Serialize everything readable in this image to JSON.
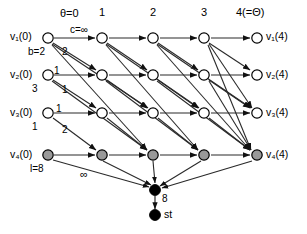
{
  "diagram": {
    "type": "time-expanded-network",
    "title": "",
    "column_headers": [
      {
        "id": "col0",
        "text": "θ=0",
        "x": 64,
        "y": 14
      },
      {
        "id": "col1",
        "text": "1",
        "x": 100,
        "y": 12
      },
      {
        "id": "col2",
        "text": "2",
        "x": 151,
        "y": 12
      },
      {
        "id": "col3",
        "text": "3",
        "x": 202,
        "y": 12
      },
      {
        "id": "col4",
        "text": "4(=Θ)",
        "x": 239,
        "y": 12
      }
    ],
    "left_labels": [
      {
        "id": "v1-0",
        "text": "v₁(0)",
        "x": 11,
        "y": 32
      },
      {
        "id": "v2-0",
        "text": "v₂(0)",
        "x": 11,
        "y": 69
      },
      {
        "id": "v3-0",
        "text": "v₃(0)",
        "x": 11,
        "y": 107
      },
      {
        "id": "v4-0",
        "text": "v₄(0)",
        "x": 11,
        "y": 149
      }
    ],
    "right_labels": [
      {
        "id": "v1-4",
        "text": "v₁(4)",
        "x": 267,
        "y": 32
      },
      {
        "id": "v2-4",
        "text": "v₂(4)",
        "x": 267,
        "y": 69
      },
      {
        "id": "v3-4",
        "text": "v₃(4)",
        "x": 267,
        "y": 107
      },
      {
        "id": "v4-4",
        "text": "v₄(4)",
        "x": 267,
        "y": 149
      }
    ],
    "parameters": [
      {
        "id": "capacity",
        "text": "c=∞",
        "x": 73,
        "y": 28
      },
      {
        "id": "b-value",
        "text": "b=2",
        "x": 29,
        "y": 48
      },
      {
        "id": "transit-3",
        "text": "3",
        "x": 33,
        "y": 85
      },
      {
        "id": "transit-1",
        "text": "1",
        "x": 33,
        "y": 123
      },
      {
        "id": "supply",
        "text": "l=8",
        "x": 31,
        "y": 165
      }
    ],
    "edge_labels": [
      {
        "id": "e-2a",
        "text": "2",
        "x": 63,
        "y": 49
      },
      {
        "id": "e-1a",
        "text": "1",
        "x": 55,
        "y": 68
      },
      {
        "id": "e-1b",
        "text": "1",
        "x": 63,
        "y": 86
      },
      {
        "id": "e-1c",
        "text": "1",
        "x": 57,
        "y": 105
      },
      {
        "id": "e-2b",
        "text": "2",
        "x": 63,
        "y": 127
      },
      {
        "id": "e-inf",
        "text": "∞",
        "x": 82,
        "y": 170
      },
      {
        "id": "e-8",
        "text": "8",
        "x": 163,
        "y": 197
      }
    ],
    "sink_label": {
      "id": "st",
      "text": "st",
      "x": 165,
      "y": 210
    },
    "rows": [
      {
        "name": "v1",
        "y": 38,
        "filled": false
      },
      {
        "name": "v2",
        "y": 75,
        "filled": false
      },
      {
        "name": "v3",
        "y": 113,
        "filled": false
      },
      {
        "name": "v4",
        "y": 155,
        "filled": true
      }
    ],
    "columns_x": [
      48,
      102,
      153,
      204,
      257
    ],
    "nodes": [
      {
        "id": "v1-t0",
        "row": 0,
        "col": 0,
        "x": 48,
        "y": 38,
        "fill": "white"
      },
      {
        "id": "v1-t1",
        "row": 0,
        "col": 1,
        "x": 102,
        "y": 38,
        "fill": "white"
      },
      {
        "id": "v1-t2",
        "row": 0,
        "col": 2,
        "x": 153,
        "y": 38,
        "fill": "white"
      },
      {
        "id": "v1-t3",
        "row": 0,
        "col": 3,
        "x": 204,
        "y": 38,
        "fill": "white"
      },
      {
        "id": "v1-t4",
        "row": 0,
        "col": 4,
        "x": 257,
        "y": 38,
        "fill": "white"
      },
      {
        "id": "v2-t0",
        "row": 1,
        "col": 0,
        "x": 48,
        "y": 75,
        "fill": "white"
      },
      {
        "id": "v2-t1",
        "row": 1,
        "col": 1,
        "x": 102,
        "y": 75,
        "fill": "white"
      },
      {
        "id": "v2-t2",
        "row": 1,
        "col": 2,
        "x": 153,
        "y": 75,
        "fill": "white"
      },
      {
        "id": "v2-t3",
        "row": 1,
        "col": 3,
        "x": 204,
        "y": 75,
        "fill": "white"
      },
      {
        "id": "v2-t4",
        "row": 1,
        "col": 4,
        "x": 257,
        "y": 75,
        "fill": "white"
      },
      {
        "id": "v3-t0",
        "row": 2,
        "col": 0,
        "x": 48,
        "y": 113,
        "fill": "white"
      },
      {
        "id": "v3-t1",
        "row": 2,
        "col": 1,
        "x": 102,
        "y": 113,
        "fill": "white"
      },
      {
        "id": "v3-t2",
        "row": 2,
        "col": 2,
        "x": 153,
        "y": 113,
        "fill": "white"
      },
      {
        "id": "v3-t3",
        "row": 2,
        "col": 3,
        "x": 204,
        "y": 113,
        "fill": "white"
      },
      {
        "id": "v3-t4",
        "row": 2,
        "col": 4,
        "x": 257,
        "y": 113,
        "fill": "white"
      },
      {
        "id": "v4-t0",
        "row": 3,
        "col": 0,
        "x": 48,
        "y": 155,
        "fill": "gray"
      },
      {
        "id": "v4-t1",
        "row": 3,
        "col": 1,
        "x": 102,
        "y": 155,
        "fill": "gray"
      },
      {
        "id": "v4-t2",
        "row": 3,
        "col": 2,
        "x": 153,
        "y": 155,
        "fill": "gray"
      },
      {
        "id": "v4-t3",
        "row": 3,
        "col": 3,
        "x": 204,
        "y": 155,
        "fill": "gray"
      },
      {
        "id": "v4-t4",
        "row": 3,
        "col": 4,
        "x": 257,
        "y": 155,
        "fill": "gray"
      },
      {
        "id": "super-sink",
        "row": 4,
        "col": 2,
        "x": 155,
        "y": 190,
        "fill": "black"
      },
      {
        "id": "terminal-st",
        "row": 5,
        "col": 2,
        "x": 155,
        "y": 215,
        "fill": "black"
      }
    ],
    "colors": {
      "node_outline": "#000000",
      "node_white": "#ffffff",
      "node_gray": "#999999",
      "node_black": "#000000",
      "edge": "#1a1a1a",
      "background": "#ffffff"
    }
  }
}
